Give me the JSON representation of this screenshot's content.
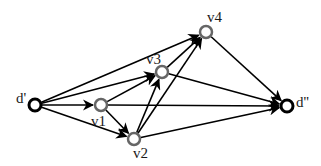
{
  "diagram": {
    "type": "directed-graph",
    "nodes": [
      {
        "id": "d1",
        "label": "d'",
        "x": 35,
        "y": 105,
        "stroke": "#000000",
        "stroke_width": 3,
        "lx": 16,
        "ly": 103
      },
      {
        "id": "v1",
        "label": "v1",
        "x": 101,
        "y": 105,
        "stroke": "#666666",
        "stroke_width": 2.5,
        "lx": 91,
        "ly": 126
      },
      {
        "id": "v2",
        "label": "v2",
        "x": 134,
        "y": 139,
        "stroke": "#666666",
        "stroke_width": 2.5,
        "lx": 133,
        "ly": 158
      },
      {
        "id": "v3",
        "label": "v3",
        "x": 162,
        "y": 72,
        "stroke": "#666666",
        "stroke_width": 2.5,
        "lx": 146,
        "ly": 64
      },
      {
        "id": "v4",
        "label": "v4",
        "x": 206,
        "y": 32,
        "stroke": "#666666",
        "stroke_width": 2.5,
        "lx": 207,
        "ly": 22
      },
      {
        "id": "d2",
        "label": "d''",
        "x": 287,
        "y": 106,
        "stroke": "#000000",
        "stroke_width": 3,
        "lx": 296,
        "ly": 107
      }
    ],
    "edges": [
      {
        "from": "d1",
        "to": "v1"
      },
      {
        "from": "d1",
        "to": "v2"
      },
      {
        "from": "d1",
        "to": "v3"
      },
      {
        "from": "d1",
        "to": "v4"
      },
      {
        "from": "v1",
        "to": "v2"
      },
      {
        "from": "v1",
        "to": "v3"
      },
      {
        "from": "v1",
        "to": "d2"
      },
      {
        "from": "v2",
        "to": "v3"
      },
      {
        "from": "v2",
        "to": "v4"
      },
      {
        "from": "v2",
        "to": "d2"
      },
      {
        "from": "v3",
        "to": "v4"
      },
      {
        "from": "v3",
        "to": "d2"
      },
      {
        "from": "v4",
        "to": "d2"
      }
    ],
    "colors": {
      "edge": "#000000",
      "source_sink_node": "#000000",
      "intermediate_node": "#666666",
      "background": "#ffffff"
    }
  }
}
